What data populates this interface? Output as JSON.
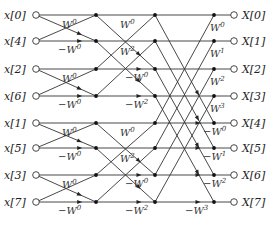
{
  "inputs": [
    "x[0]",
    "x[4]",
    "x[2]",
    "x[6]",
    "x[1]",
    "x[5]",
    "x[3]",
    "x[7]"
  ],
  "outputs": [
    "X[0]",
    "X[1]",
    "X[2]",
    "X[3]",
    "X[4]",
    "X[5]",
    "X[6]",
    "X[7]"
  ],
  "stages": [
    {
      "span": 1,
      "twiddles": [
        {
          "row": 0,
          "neg": false,
          "exp": "0"
        },
        {
          "row": 2,
          "neg": false,
          "exp": "0"
        },
        {
          "row": 4,
          "neg": false,
          "exp": "0"
        },
        {
          "row": 6,
          "neg": false,
          "exp": "0"
        }
      ],
      "neg_twiddles": [
        {
          "row": 1,
          "exp": "0"
        },
        {
          "row": 3,
          "exp": "0"
        },
        {
          "row": 5,
          "exp": "0"
        },
        {
          "row": 7,
          "exp": "0"
        }
      ]
    },
    {
      "span": 2,
      "twiddles": [
        {
          "row": 0,
          "exp": "0"
        },
        {
          "row": 1,
          "exp": "2"
        },
        {
          "row": 4,
          "exp": "0"
        },
        {
          "row": 5,
          "exp": "2"
        }
      ],
      "neg_twiddles": [
        {
          "row": 2,
          "exp": "0"
        },
        {
          "row": 3,
          "exp": "2"
        },
        {
          "row": 6,
          "exp": "0"
        },
        {
          "row": 7,
          "exp": "2"
        }
      ]
    },
    {
      "span": 4,
      "twiddles": [
        {
          "row": 0,
          "exp": "0"
        },
        {
          "row": 1,
          "exp": "1"
        },
        {
          "row": 2,
          "exp": "2"
        },
        {
          "row": 3,
          "exp": "3"
        }
      ],
      "neg_twiddles": [
        {
          "row": 4,
          "exp": "0"
        },
        {
          "row": 5,
          "exp": "1"
        },
        {
          "row": 6,
          "exp": "2"
        },
        {
          "row": 7,
          "exp": "3"
        }
      ]
    }
  ],
  "twiddle_symbol": "W",
  "negative_sign": "−"
}
